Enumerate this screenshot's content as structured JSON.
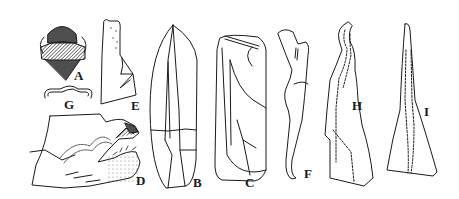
{
  "figure": {
    "labels": [
      {
        "id": "A",
        "text": "A",
        "x": 74,
        "y": 69
      },
      {
        "id": "B",
        "text": "B",
        "x": 193,
        "y": 176
      },
      {
        "id": "C",
        "text": "C",
        "x": 245,
        "y": 176
      },
      {
        "id": "D",
        "text": "D",
        "x": 136,
        "y": 174
      },
      {
        "id": "E",
        "text": "E",
        "x": 131,
        "y": 99
      },
      {
        "id": "F",
        "text": "F",
        "x": 304,
        "y": 167
      },
      {
        "id": "G",
        "text": "G",
        "x": 64,
        "y": 98
      },
      {
        "id": "H",
        "text": "H",
        "x": 352,
        "y": 99
      },
      {
        "id": "I",
        "text": "I",
        "x": 424,
        "y": 105
      }
    ],
    "colors": {
      "ink": "#1a1a1a",
      "background": "#ffffff",
      "stipple": "#777777"
    }
  }
}
